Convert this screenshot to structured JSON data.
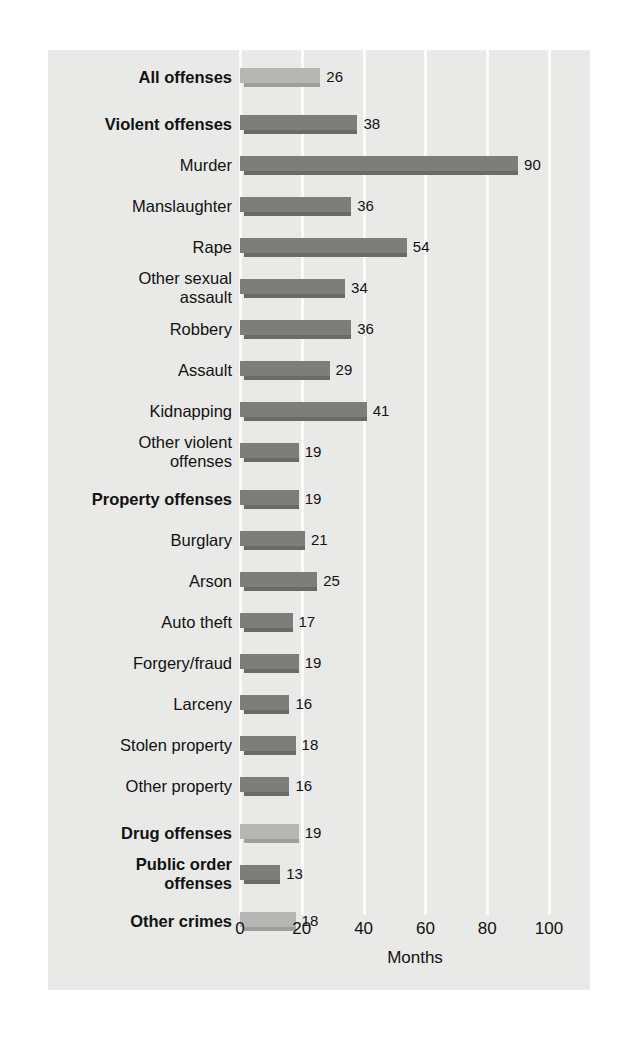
{
  "chart_data": {
    "type": "bar",
    "orientation": "horizontal",
    "title": "",
    "xlabel": "Months",
    "ylabel": "",
    "xlim": [
      0,
      100
    ],
    "xticks": [
      0,
      20,
      40,
      60,
      80,
      100
    ],
    "xtick_labels": [
      "0",
      "20",
      "40",
      "60",
      "80",
      "100"
    ],
    "grid": "vertical-white",
    "legend": "none",
    "categories": [
      "All offenses",
      "Violent offenses",
      "Murder",
      "Manslaughter",
      "Rape",
      "Other sexual\nassault",
      "Robbery",
      "Assault",
      "Kidnapping",
      "Other violent\noffenses",
      "Property offenses",
      "Burglary",
      "Arson",
      "Auto theft",
      "Forgery/fraud",
      "Larceny",
      "Stolen property",
      "Other property",
      "Drug offenses",
      "Public order\noffenses",
      "Other crimes"
    ],
    "values": [
      26,
      38,
      90,
      36,
      54,
      34,
      36,
      29,
      41,
      19,
      19,
      21,
      25,
      17,
      19,
      16,
      18,
      16,
      19,
      13,
      18
    ],
    "value_labels": [
      "26",
      "38",
      "90",
      "36",
      "54",
      "34",
      "36",
      "29",
      "41",
      "19",
      "19",
      "21",
      "25",
      "17",
      "19",
      "16",
      "18",
      "16",
      "19",
      "13",
      "18"
    ]
  },
  "rows": [
    {
      "label": "All offenses",
      "value": 26,
      "value_label": "26",
      "bold": true,
      "style": "light",
      "y": 18,
      "lines": 1
    },
    {
      "label": "Violent offenses",
      "value": 38,
      "value_label": "38",
      "bold": true,
      "style": "dark",
      "y": 65,
      "lines": 1
    },
    {
      "label": "Murder",
      "value": 90,
      "value_label": "90",
      "bold": false,
      "style": "dark",
      "y": 106,
      "lines": 1
    },
    {
      "label": "Manslaughter",
      "value": 36,
      "value_label": "36",
      "bold": false,
      "style": "dark",
      "y": 147,
      "lines": 1
    },
    {
      "label": "Rape",
      "value": 54,
      "value_label": "54",
      "bold": false,
      "style": "dark",
      "y": 188,
      "lines": 1
    },
    {
      "label": "Other sexual\nassault",
      "value": 34,
      "value_label": "34",
      "bold": false,
      "style": "dark",
      "y": 229,
      "lines": 2
    },
    {
      "label": "Robbery",
      "value": 36,
      "value_label": "36",
      "bold": false,
      "style": "dark",
      "y": 270,
      "lines": 1
    },
    {
      "label": "Assault",
      "value": 29,
      "value_label": "29",
      "bold": false,
      "style": "dark",
      "y": 311,
      "lines": 1
    },
    {
      "label": "Kidnapping",
      "value": 41,
      "value_label": "41",
      "bold": false,
      "style": "dark",
      "y": 352,
      "lines": 1
    },
    {
      "label": "Other violent\noffenses",
      "value": 19,
      "value_label": "19",
      "bold": false,
      "style": "dark",
      "y": 393,
      "lines": 2
    },
    {
      "label": "Property offenses",
      "value": 19,
      "value_label": "19",
      "bold": true,
      "style": "dark",
      "y": 440,
      "lines": 1
    },
    {
      "label": "Burglary",
      "value": 21,
      "value_label": "21",
      "bold": false,
      "style": "dark",
      "y": 481,
      "lines": 1
    },
    {
      "label": "Arson",
      "value": 25,
      "value_label": "25",
      "bold": false,
      "style": "dark",
      "y": 522,
      "lines": 1
    },
    {
      "label": "Auto theft",
      "value": 17,
      "value_label": "17",
      "bold": false,
      "style": "dark",
      "y": 563,
      "lines": 1
    },
    {
      "label": "Forgery/fraud",
      "value": 19,
      "value_label": "19",
      "bold": false,
      "style": "dark",
      "y": 604,
      "lines": 1
    },
    {
      "label": "Larceny",
      "value": 16,
      "value_label": "16",
      "bold": false,
      "style": "dark",
      "y": 645,
      "lines": 1
    },
    {
      "label": "Stolen property",
      "value": 18,
      "value_label": "18",
      "bold": false,
      "style": "dark",
      "y": 686,
      "lines": 1
    },
    {
      "label": "Other property",
      "value": 16,
      "value_label": "16",
      "bold": false,
      "style": "dark",
      "y": 727,
      "lines": 1
    },
    {
      "label": "Drug offenses",
      "value": 19,
      "value_label": "19",
      "bold": true,
      "style": "light",
      "y": 774,
      "lines": 1
    },
    {
      "label": "Public order\noffenses",
      "value": 13,
      "value_label": "13",
      "bold": true,
      "style": "dark",
      "y": 815,
      "lines": 2
    },
    {
      "label": "Other crimes",
      "value": 18,
      "value_label": "18",
      "bold": true,
      "style": "light",
      "y": 862,
      "lines": 1
    }
  ],
  "axis": {
    "title": "Months",
    "ticks": [
      "0",
      "20",
      "40",
      "60",
      "80",
      "100"
    ],
    "tick_values": [
      0,
      20,
      40,
      60,
      80,
      100
    ]
  },
  "colors": {
    "panel_background": "#e9e9e7",
    "page_background": "#ffffff",
    "gridline": "#fbfbfa",
    "bar_light": "#b6b6b4",
    "bar_light_shadow": "#9e9e9c",
    "bar_dark": "#7d7d7b",
    "bar_dark_shadow": "#6a6a68",
    "text": "#121212"
  }
}
